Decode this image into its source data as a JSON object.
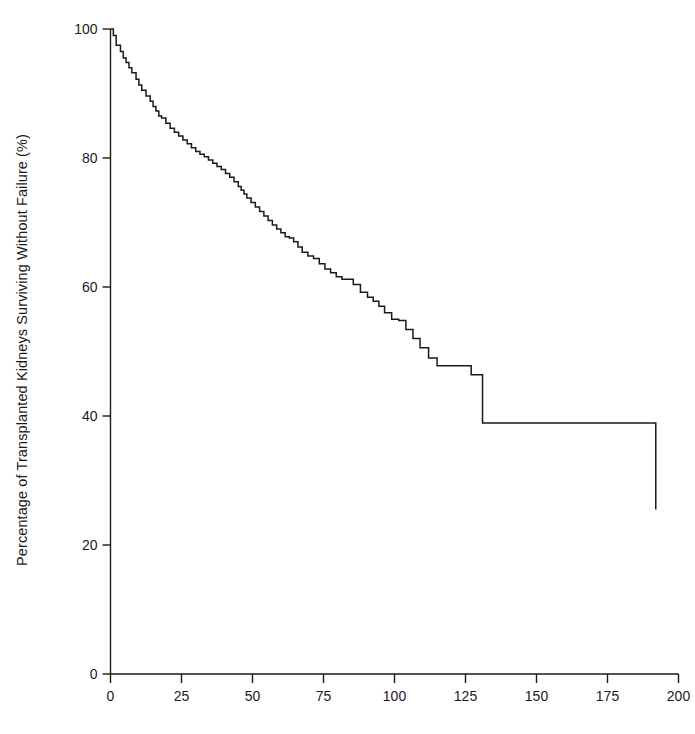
{
  "figure": {
    "background": "#ffffff",
    "line_color": "#1a1a1a",
    "axis_color": "#1a1a1a"
  },
  "ylabel_text": "Percentage of Transplanted Kidneys Surviving Without Failure (%)",
  "chart_data": {
    "type": "line",
    "subtype": "kaplan-meier-step",
    "title": "",
    "subtitle": "",
    "xlabel": "",
    "ylabel": "Percentage of Transplanted Kidneys Surviving Without Failure (%)",
    "xlim": [
      0,
      200
    ],
    "ylim": [
      0,
      100
    ],
    "xticks": [
      0,
      25,
      50,
      75,
      100,
      125,
      150,
      175,
      200
    ],
    "xtick_labels": [
      "0",
      "25",
      "50",
      "75",
      "100",
      "125",
      "150",
      "175",
      "200"
    ],
    "yticks": [
      0,
      20,
      40,
      60,
      80,
      100
    ],
    "ytick_labels": [
      "0",
      "20",
      "40",
      "60",
      "80",
      "100"
    ],
    "grid": false,
    "legend": false,
    "legend_position": "none",
    "series": [
      {
        "name": "Graft survival",
        "step": "post",
        "x": [
          0,
          1,
          2,
          3.5,
          4.5,
          5.5,
          6.5,
          7.5,
          9,
          10,
          11,
          12.5,
          14,
          15,
          16,
          17,
          18,
          19.5,
          21,
          22.5,
          24,
          25.5,
          27,
          28.5,
          30,
          31.5,
          33,
          34.5,
          36,
          37.5,
          39,
          40.5,
          42,
          43.5,
          45,
          46,
          47,
          48,
          49.5,
          51,
          52.5,
          54,
          55.5,
          57,
          58.5,
          60,
          61.5,
          63,
          64.5,
          66,
          67.5,
          69.5,
          71.5,
          73.5,
          75.5,
          77.5,
          79.5,
          81.5,
          83.5,
          85.5,
          88,
          90.5,
          92.5,
          94.5,
          96.5,
          99,
          101.5,
          104,
          106.5,
          109,
          112,
          115,
          118,
          122,
          127,
          131,
          169,
          192
        ],
        "y": [
          100,
          99,
          97.5,
          96.5,
          95.5,
          94.8,
          94.0,
          93.2,
          92.2,
          91.3,
          90.5,
          89.6,
          88.8,
          88.0,
          87.3,
          86.5,
          86.2,
          85.4,
          84.6,
          84.0,
          83.4,
          82.8,
          82.2,
          81.6,
          81.0,
          80.6,
          80.2,
          79.7,
          79.2,
          78.7,
          78.2,
          77.6,
          77.0,
          76.3,
          75.6,
          75.0,
          74.4,
          73.8,
          73.1,
          72.4,
          71.7,
          71.0,
          70.3,
          69.6,
          69.0,
          68.4,
          67.8,
          67.6,
          67.0,
          66.2,
          65.4,
          64.8,
          64.4,
          63.6,
          62.8,
          62.2,
          61.6,
          61.2,
          61.2,
          60.4,
          59.2,
          58.4,
          57.8,
          57.0,
          56.0,
          55.0,
          54.8,
          53.4,
          52.0,
          50.6,
          49.0,
          47.8,
          47.8,
          47.8,
          46.4,
          38.9,
          38.9,
          25.5
        ],
        "notes": "Monotonically decreasing step function; steep early decline, long plateau 131-169, large terminal drop at ~169 from 38.9% to 25.5%"
      }
    ]
  }
}
